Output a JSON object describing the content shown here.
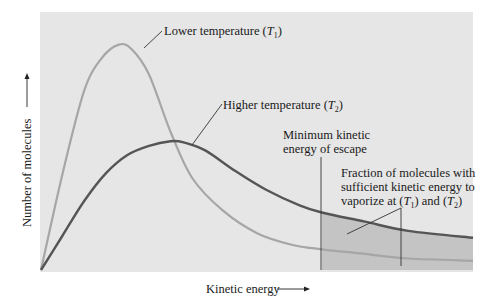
{
  "chart_data": {
    "type": "line",
    "title": "",
    "xlabel": "Kinetic energy",
    "ylabel": "Number of molecules",
    "grid": false,
    "legend": "none",
    "x_range": [
      0,
      1
    ],
    "y_range": [
      0,
      1
    ],
    "series": [
      {
        "name": "Lower temperature (T1)",
        "label_main": "Lower temperature (",
        "label_var": "T",
        "label_sub": "1",
        "label_end": ")",
        "color": "#a8a8a8",
        "x": [
          0.0,
          0.05,
          0.1,
          0.14,
          0.18,
          0.21,
          0.25,
          0.3,
          0.35,
          0.42,
          0.5,
          0.58,
          0.65,
          0.75,
          0.85,
          1.0
        ],
        "values": [
          0.0,
          0.42,
          0.78,
          0.92,
          0.98,
          0.96,
          0.85,
          0.6,
          0.4,
          0.26,
          0.16,
          0.11,
          0.09,
          0.07,
          0.05,
          0.04
        ]
      },
      {
        "name": "Higher temperature (T2)",
        "label_main": "Higher temperature (",
        "label_var": "T",
        "label_sub": "2",
        "label_end": ")",
        "color": "#5a5a5a",
        "x": [
          0.0,
          0.05,
          0.1,
          0.15,
          0.2,
          0.25,
          0.3,
          0.33,
          0.38,
          0.45,
          0.52,
          0.6,
          0.65,
          0.75,
          0.85,
          1.0
        ],
        "values": [
          0.0,
          0.15,
          0.3,
          0.42,
          0.5,
          0.54,
          0.56,
          0.555,
          0.52,
          0.43,
          0.35,
          0.28,
          0.25,
          0.21,
          0.17,
          0.14
        ]
      }
    ],
    "annotations": [
      {
        "id": "threshold",
        "text_lines": [
          "Minimum kinetic",
          "energy of escape"
        ],
        "x": 0.65
      },
      {
        "id": "fraction",
        "text_lines": [
          "Fraction of molecules with",
          "sufficient kinetic energy to",
          "vaporize at"
        ],
        "var1": "T",
        "sub1": "1",
        "and_text": "and",
        "var2": "T",
        "sub2": "2"
      }
    ],
    "shaded_region": {
      "from_x": 0.65,
      "to_x": 1.0,
      "color": "#bdbdbd",
      "description": "area under curves beyond minimum kinetic energy of escape"
    }
  },
  "colors": {
    "plot_background": "#e6e6e6",
    "shade": "#c4c4c4",
    "t1_curve": "#a6a6a6",
    "t2_curve": "#555555",
    "text": "#1a1a1a"
  }
}
